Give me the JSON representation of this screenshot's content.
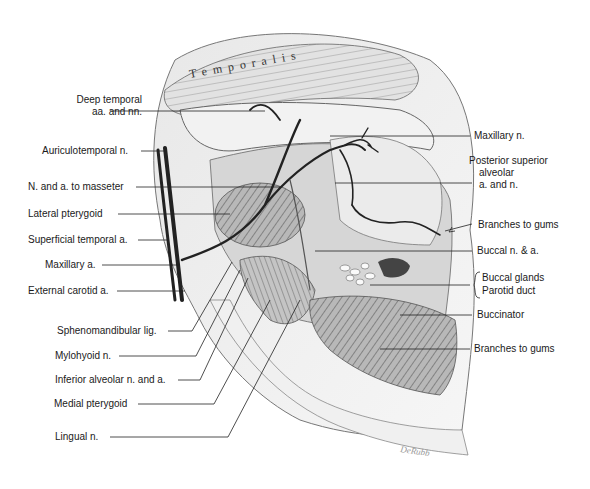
{
  "figure": {
    "type": "anatomical illustration",
    "structure_label": "Temporalis",
    "signature": "DeRubb"
  },
  "labels_left": [
    {
      "id": "deep-temporal",
      "text": "Deep temporal",
      "text2": "aa. and nn."
    },
    {
      "id": "auriculotemporal",
      "text": "Auriculotemporal n."
    },
    {
      "id": "masseter",
      "text": "N. and a. to masseter"
    },
    {
      "id": "lateral-pterygoid",
      "text": "Lateral pterygoid"
    },
    {
      "id": "superficial-temporal",
      "text": "Superficial temporal a."
    },
    {
      "id": "maxillary-a",
      "text": "Maxillary a."
    },
    {
      "id": "external-carotid",
      "text": "External carotid a."
    },
    {
      "id": "sphenomandibular",
      "text": "Sphenomandibular lig."
    },
    {
      "id": "mylohyoid",
      "text": "Mylohyoid n."
    },
    {
      "id": "inferior-alveolar",
      "text": "Inferior alveolar n. and a."
    },
    {
      "id": "medial-pterygoid",
      "text": "Medial pterygoid"
    },
    {
      "id": "lingual",
      "text": "Lingual n."
    }
  ],
  "labels_right": [
    {
      "id": "maxillary-n",
      "text": "Maxillary n."
    },
    {
      "id": "posterior-superior",
      "text": "Posterior superior",
      "text2": "alveolar",
      "text3": "a. and n."
    },
    {
      "id": "branches-gums-1",
      "text": "Branches to gums"
    },
    {
      "id": "buccal-na",
      "text": "Buccal n. & a."
    },
    {
      "id": "buccal-glands",
      "text": "Buccal glands"
    },
    {
      "id": "parotid-duct",
      "text": "Parotid duct"
    },
    {
      "id": "buccinator",
      "text": "Buccinator"
    },
    {
      "id": "branches-gums-2",
      "text": "Branches to gums"
    }
  ]
}
